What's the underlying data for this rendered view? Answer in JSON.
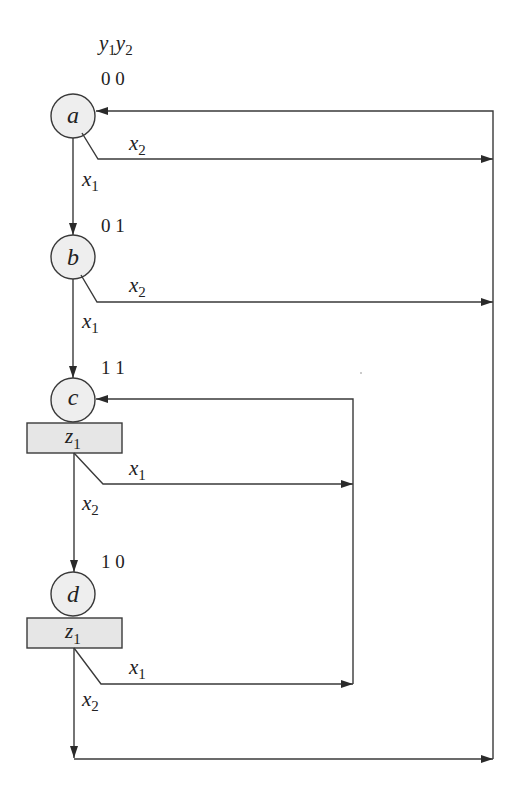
{
  "diagram": {
    "type": "ASM / state diagram",
    "header": {
      "var1": "y",
      "sub1": "1",
      "var2": "y",
      "sub2": "2"
    },
    "states": [
      {
        "id": "a",
        "name": "a",
        "code": "0 0",
        "output": null
      },
      {
        "id": "b",
        "name": "b",
        "code": "0 1",
        "output": null
      },
      {
        "id": "c",
        "name": "c",
        "code": "1 1",
        "output": {
          "var": "z",
          "sub": "1"
        }
      },
      {
        "id": "d",
        "name": "d",
        "code": "1 0",
        "output": {
          "var": "z",
          "sub": "1"
        }
      }
    ],
    "conditions": {
      "a_down": {
        "var": "x",
        "sub": "1"
      },
      "a_right": {
        "var": "x",
        "sub": "2"
      },
      "b_down": {
        "var": "x",
        "sub": "1"
      },
      "b_right": {
        "var": "x",
        "sub": "2"
      },
      "c_right": {
        "var": "x",
        "sub": "1"
      },
      "c_down": {
        "var": "x",
        "sub": "2"
      },
      "d_right": {
        "var": "x",
        "sub": "1"
      },
      "d_down": {
        "var": "x",
        "sub": "2"
      }
    },
    "transitions": [
      {
        "from": "a",
        "to": "b",
        "on": "x1"
      },
      {
        "from": "a",
        "to": "a",
        "on": "x2"
      },
      {
        "from": "b",
        "to": "c",
        "on": "x1"
      },
      {
        "from": "b",
        "to": "a",
        "on": "x2"
      },
      {
        "from": "c",
        "to": "c",
        "on": "x1"
      },
      {
        "from": "c",
        "to": "d",
        "on": "x2"
      },
      {
        "from": "d",
        "to": "c",
        "on": "x1"
      },
      {
        "from": "d",
        "to": "a",
        "on": "x2"
      }
    ],
    "colors": {
      "stroke": "#3a3a3a",
      "node_fill": "#eeeeee",
      "output_fill": "#e6e6e6",
      "background": "#ffffff"
    }
  }
}
